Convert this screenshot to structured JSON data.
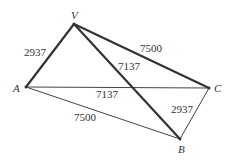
{
  "diagram": {
    "vertices": {
      "V": {
        "label": "V",
        "x": 74,
        "y": 24
      },
      "A": {
        "label": "A",
        "x": 26,
        "y": 87
      },
      "C": {
        "label": "C",
        "x": 209,
        "y": 88
      },
      "B": {
        "label": "B",
        "x": 180,
        "y": 139
      }
    },
    "edges": [
      {
        "from": "V",
        "to": "A",
        "label": "2937",
        "weight": "thick"
      },
      {
        "from": "V",
        "to": "C",
        "label": "7500",
        "weight": "thick"
      },
      {
        "from": "V",
        "to": "B",
        "label": "7137",
        "weight": "thick"
      },
      {
        "from": "A",
        "to": "C",
        "label": "7137",
        "weight": "thin"
      },
      {
        "from": "A",
        "to": "B",
        "label": "7500",
        "weight": "thin"
      },
      {
        "from": "C",
        "to": "B",
        "label": "2937",
        "weight": "thin"
      }
    ],
    "labels": {
      "va": "2937",
      "vc": "7500",
      "vb": "7137",
      "ac": "7137",
      "ab": "7500",
      "cb": "2937"
    },
    "colors": {
      "line": "#333333",
      "text": "#333333"
    }
  }
}
